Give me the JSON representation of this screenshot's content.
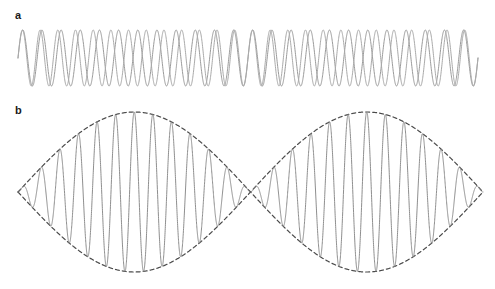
{
  "figure": {
    "background_color": "#ffffff",
    "width": 495,
    "height": 289
  },
  "panels": [
    {
      "id": "a",
      "label": "a",
      "caption": "Two sinusoidal waves of slightly different frequencies drawn on the same axis",
      "label_x": 15,
      "label_y": 10
    },
    {
      "id": "b",
      "label": "b",
      "caption": "Resultant wave showing beats, with dashed amplitude envelope",
      "label_x": 15,
      "label_y": 105
    }
  ],
  "colors": {
    "wave_one": "#9a9a9a",
    "wave_two": "#a9a9a9",
    "resultant": "#8e8e8e",
    "envelope": "#4a4a4a",
    "label_text": "#1a1a1a",
    "background": "#ffffff"
  },
  "chart_data": [
    {
      "type": "line",
      "id": "panel-a",
      "title": "a",
      "xlabel": "",
      "ylabel": "",
      "grid": false,
      "legend": "none",
      "axis_visible": false,
      "x_range_px": [
        18,
        478
      ],
      "y_center_px": 58,
      "amplitude_px": 28,
      "x_domain": [
        0,
        1
      ],
      "series": [
        {
          "name": "wave-1",
          "waveform": "sine",
          "cycles": 24,
          "phase_deg": 0,
          "amplitude": 1.0,
          "color": "#9a9a9a",
          "stroke_width": 1.0,
          "dash": "none"
        },
        {
          "name": "wave-2",
          "waveform": "sine",
          "cycles": 26,
          "phase_deg": 0,
          "amplitude": 1.0,
          "color": "#a9a9a9",
          "stroke_width": 1.0,
          "dash": "none"
        }
      ]
    },
    {
      "type": "line",
      "id": "panel-b",
      "title": "b",
      "xlabel": "",
      "ylabel": "",
      "grid": false,
      "legend": "none",
      "axis_visible": false,
      "x_range_px": [
        18,
        483
      ],
      "y_center_px": 92,
      "amplitude_px": 80,
      "x_domain": [
        0,
        1
      ],
      "beat_nodes": 1,
      "node_x_px": 252,
      "series": [
        {
          "name": "resultant",
          "waveform": "sum-of-sines",
          "carrier_cycles": 25,
          "beat_cycles": 1,
          "phase_deg": 0,
          "amplitude": 1.0,
          "color": "#8e8e8e",
          "stroke_width": 1.0,
          "dash": "none"
        },
        {
          "name": "envelope-upper",
          "waveform": "cosine-envelope",
          "beat_cycles": 1,
          "amplitude": 1.0,
          "color": "#4a4a4a",
          "stroke_width": 1.2,
          "dash": "4,3"
        },
        {
          "name": "envelope-lower",
          "waveform": "cosine-envelope",
          "beat_cycles": 1,
          "amplitude": -1.0,
          "color": "#4a4a4a",
          "stroke_width": 1.2,
          "dash": "4,3"
        }
      ]
    }
  ]
}
